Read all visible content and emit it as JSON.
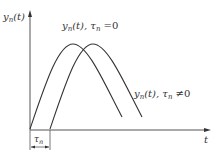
{
  "diagram": {
    "type": "signal-delay-plot",
    "y_axis": {
      "label_main": "y",
      "label_sub": "n",
      "label_arg": "(t)"
    },
    "x_axis": {
      "label": "t"
    },
    "curves": [
      {
        "name": "undelayed",
        "label_main": "y",
        "label_sub": "n",
        "label_arg": "(t), ",
        "param_main": "τ",
        "param_sub": "n",
        "param_rel": " =0"
      },
      {
        "name": "delayed",
        "label_main": "y",
        "label_sub": "n",
        "label_arg": "(t), ",
        "param_main": "τ",
        "param_sub": "n",
        "param_rel": " ≠0"
      }
    ],
    "delay_marker": {
      "label_main": "τ",
      "label_sub": "n"
    },
    "colors": {
      "line": "#333333",
      "axis": "#555555",
      "background": "#ffffff"
    }
  }
}
